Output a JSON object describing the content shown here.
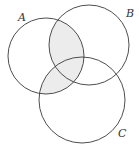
{
  "diagram": {
    "type": "venn",
    "sets": [
      {
        "id": "A",
        "label": "A",
        "cx": 46,
        "cy": 56,
        "r": 38,
        "label_x": 18,
        "label_y": 21
      },
      {
        "id": "B",
        "label": "B",
        "cx": 89,
        "cy": 45,
        "r": 40,
        "label_x": 126,
        "label_y": 17
      },
      {
        "id": "C",
        "label": "C",
        "cx": 82,
        "cy": 100,
        "r": 43,
        "label_x": 118,
        "label_y": 137
      }
    ],
    "shaded_region": "A ∩ (B ∪ C)",
    "colors": {
      "stroke": "#3a3a3a",
      "shade": "#ececec",
      "background": "#ffffff"
    }
  }
}
